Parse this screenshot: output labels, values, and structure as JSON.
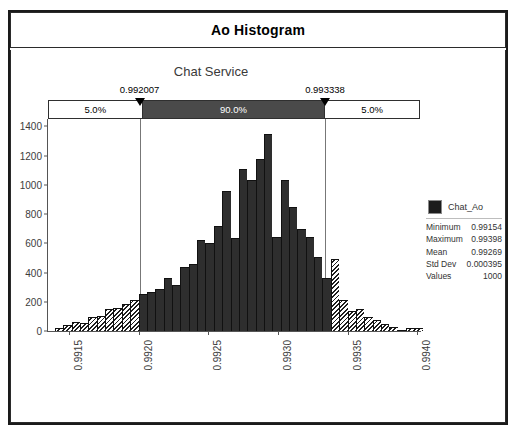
{
  "window": {
    "title": "Ao Histogram"
  },
  "chart_data": {
    "type": "bar",
    "title": "Ao Histogram",
    "subtitle": "Chat Service",
    "xlabel": "",
    "ylabel": "",
    "xlim": [
      0.99135,
      0.99402
    ],
    "ylim": [
      0,
      1450
    ],
    "grid": false,
    "legend_position": "right",
    "series_name": "Chat_Ao",
    "y_ticks": [
      0,
      200,
      400,
      600,
      800,
      1000,
      1200,
      1400
    ],
    "x_ticks": [
      "0.9915",
      "0.9920",
      "0.9925",
      "0.9930",
      "0.9935",
      "0.9940"
    ],
    "x_tick_values": [
      0.9915,
      0.992,
      0.9925,
      0.993,
      0.9935,
      0.994
    ],
    "percentile_markers": [
      {
        "label": "0.992007",
        "value": 0.992007
      },
      {
        "label": "0.993338",
        "value": 0.993338
      }
    ],
    "percentile_bands": [
      {
        "label": "5.0%",
        "width_pct": 25.0,
        "style": "light"
      },
      {
        "label": "90.0%",
        "width_pct": 49.7,
        "style": "dark"
      },
      {
        "label": "5.0%",
        "width_pct": 25.3,
        "style": "light"
      }
    ],
    "bins": [
      {
        "x": 0.9914,
        "value": 20,
        "tail": true
      },
      {
        "x": 0.99146,
        "value": 40,
        "tail": true
      },
      {
        "x": 0.99152,
        "value": 60,
        "tail": true
      },
      {
        "x": 0.99158,
        "value": 55,
        "tail": true
      },
      {
        "x": 0.99164,
        "value": 95,
        "tail": true
      },
      {
        "x": 0.9917,
        "value": 100,
        "tail": true
      },
      {
        "x": 0.99176,
        "value": 150,
        "tail": true
      },
      {
        "x": 0.99182,
        "value": 160,
        "tail": true
      },
      {
        "x": 0.99188,
        "value": 185,
        "tail": true
      },
      {
        "x": 0.99194,
        "value": 215,
        "tail": true
      },
      {
        "x": 0.992,
        "value": 250,
        "tail": false
      },
      {
        "x": 0.99206,
        "value": 265,
        "tail": false
      },
      {
        "x": 0.99212,
        "value": 290,
        "tail": false
      },
      {
        "x": 0.99218,
        "value": 365,
        "tail": false
      },
      {
        "x": 0.99224,
        "value": 315,
        "tail": false
      },
      {
        "x": 0.9923,
        "value": 440,
        "tail": false
      },
      {
        "x": 0.99236,
        "value": 455,
        "tail": false
      },
      {
        "x": 0.99242,
        "value": 620,
        "tail": false
      },
      {
        "x": 0.99248,
        "value": 600,
        "tail": false
      },
      {
        "x": 0.99254,
        "value": 715,
        "tail": false
      },
      {
        "x": 0.9926,
        "value": 960,
        "tail": false
      },
      {
        "x": 0.99266,
        "value": 635,
        "tail": false
      },
      {
        "x": 0.99272,
        "value": 1105,
        "tail": false
      },
      {
        "x": 0.99278,
        "value": 1030,
        "tail": false
      },
      {
        "x": 0.99284,
        "value": 1175,
        "tail": false
      },
      {
        "x": 0.9929,
        "value": 1350,
        "tail": false
      },
      {
        "x": 0.99296,
        "value": 640,
        "tail": false
      },
      {
        "x": 0.99302,
        "value": 1030,
        "tail": false
      },
      {
        "x": 0.99308,
        "value": 850,
        "tail": false
      },
      {
        "x": 0.99314,
        "value": 700,
        "tail": false
      },
      {
        "x": 0.9932,
        "value": 640,
        "tail": false
      },
      {
        "x": 0.99326,
        "value": 505,
        "tail": false
      },
      {
        "x": 0.99332,
        "value": 360,
        "tail": false
      },
      {
        "x": 0.99338,
        "value": 490,
        "tail": true
      },
      {
        "x": 0.99344,
        "value": 215,
        "tail": true
      },
      {
        "x": 0.9935,
        "value": 140,
        "tail": true
      },
      {
        "x": 0.99356,
        "value": 150,
        "tail": true
      },
      {
        "x": 0.99362,
        "value": 95,
        "tail": true
      },
      {
        "x": 0.99368,
        "value": 75,
        "tail": true
      },
      {
        "x": 0.99374,
        "value": 45,
        "tail": true
      },
      {
        "x": 0.9938,
        "value": 30,
        "tail": true
      },
      {
        "x": 0.99386,
        "value": 10,
        "tail": true
      },
      {
        "x": 0.99392,
        "value": 22,
        "tail": true
      },
      {
        "x": 0.99398,
        "value": 20,
        "tail": true
      }
    ]
  },
  "legend": {
    "series_label": "Chat_Ao"
  },
  "stats": {
    "rows": [
      {
        "name": "Minimum",
        "value": "0.99154"
      },
      {
        "name": "Maximum",
        "value": "0.99398"
      },
      {
        "name": "Mean",
        "value": "0.99269"
      },
      {
        "name": "Std Dev",
        "value": "0.000395"
      },
      {
        "name": "Values",
        "value": "1000"
      }
    ]
  },
  "colors": {
    "bar": "#2e2e2e",
    "band_dark": "#4a4a4a",
    "frame": "#1a1a1a"
  }
}
